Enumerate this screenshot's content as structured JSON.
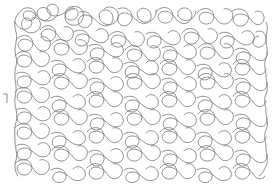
{
  "image": {
    "title": "Stipple Meander Quilting Pattern",
    "kind": "line-drawing",
    "width": 279,
    "height": 195,
    "background_color": "#ffffff",
    "stroke_color": "#7d7d7d",
    "stroke_width": 0.85,
    "description": "Continuous wandering meander / stipple quilting motif filling a rectangular field with interlocking puzzle-piece lobes."
  },
  "pattern": {
    "name": "stipple-meander",
    "region": {
      "x": 14,
      "y": 6,
      "width": 252,
      "height": 176
    },
    "cell": 22,
    "lobe_radius": 8.5,
    "seed": 20240517,
    "row_count": 8,
    "column_count": 11,
    "density_label": "dense",
    "paths": [
      "M 18 14 C 22 6, 32 6, 35 12 C 38 18, 32 22, 27 20 C 22 18, 22 12, 27 11 C 33 10, 36 16, 40 19 C 46 23, 52 18, 50 12 C 48 7, 41 6, 38 10 C 35 14, 39 20, 45 21 C 54 22, 60 14, 58 8 C 57 4, 51 3, 48 6 C 45 10, 49 16, 55 16 C 64 16, 68 8, 72 8 C 78 8, 80 14, 76 18 C 72 22, 65 20, 65 14 C 65 8, 72 5, 78 7 C 84 9, 85 17, 81 22 C 77 27, 69 26, 66 21 C 63 16, 67 9, 74 9",
      "M 80 12 C 86 10, 92 14, 92 20 C 92 27, 84 30, 80 26 C 76 22, 79 15, 85 15 C 92 15, 96 21, 100 24 C 106 28, 113 25, 113 18 C 113 12, 107 8, 102 11 C 97 14, 99 22, 105 24 C 113 27, 120 20, 118 13 C 116 7, 108 5, 104 9",
      "M 118 9 C 124 6, 131 9, 132 16 C 133 23, 126 28, 121 25 C 116 22, 117 14, 123 13 C 130 12, 134 19, 139 22 C 145 26, 152 22, 151 15 C 150 9, 143 6, 139 10 C 135 14, 138 21, 144 22 C 152 23, 157 16, 156 10",
      "M 156 12 C 160 6, 169 6, 172 12 C 175 18, 170 24, 164 23 C 158 22, 156 15, 161 12 C 167 9, 173 14, 176 19 C 180 25, 188 25, 191 19 C 194 13, 189 7, 183 8 C 177 9, 176 16, 181 19 C 188 23, 196 18, 196 11",
      "M 197 13 C 201 7, 210 7, 213 13 C 216 19, 211 25, 205 24 C 199 23, 197 16, 202 13 C 208 10, 214 15, 217 20 C 221 26, 229 25, 232 19 C 235 13, 230 7, 224 9",
      "M 232 11 C 238 7, 246 9, 248 15 C 250 21, 245 27, 239 26 C 233 25, 231 18, 236 15 C 242 12, 249 16, 252 21 C 256 27, 263 25, 264 19 C 265 13, 259 9, 255 12",
      "M 15 22 C 18 30, 26 31, 30 27 C 34 23, 31 17, 26 18 C 21 19, 20 26, 24 30 C 29 35, 38 33, 40 27 C 42 21, 37 16, 32 18",
      "M 40 30 C 44 24, 52 24, 55 30 C 58 36, 53 42, 47 41 C 41 40, 39 33, 44 30 C 50 27, 56 32, 59 37 C 63 43, 71 42, 73 36 C 75 30, 69 25, 64 27",
      "M 74 32 C 80 28, 88 31, 89 37 C 90 44, 83 48, 78 45 C 73 42, 75 35, 81 34 C 88 33, 92 40, 97 42 C 104 45, 110 40, 108 34 C 106 28, 99 27, 96 31",
      "M 109 36 C 113 30, 122 30, 125 36 C 128 42, 123 48, 117 47 C 111 46, 109 39, 114 36 C 120 33, 127 38, 130 43 C 134 49, 142 47, 144 41 C 146 35, 140 30, 135 32",
      "M 146 34 C 152 30, 160 33, 161 39 C 162 46, 155 50, 150 47 C 145 44, 147 37, 153 36 C 160 35, 164 42, 169 44 C 176 47, 182 42, 180 36 C 178 30, 171 29, 168 33",
      "M 182 33 C 186 27, 195 27, 198 33 C 201 39, 196 45, 190 44 C 184 43, 182 36, 187 33 C 193 30, 200 35, 203 40 C 207 46, 215 44, 217 38 C 219 32, 213 27, 208 29",
      "M 219 34 C 225 30, 233 33, 234 39 C 235 46, 228 50, 223 47 C 218 44, 220 37, 226 36 C 233 35, 237 42, 242 44 C 249 47, 256 42, 254 36 C 252 30, 245 29, 242 33",
      "M 256 32 C 261 29, 266 33, 266 39 C 266 46, 259 49, 255 46 C 251 43, 253 36, 259 36",
      "M 16 40 C 20 34, 29 34, 32 40 C 35 46, 30 52, 24 51 C 18 50, 16 43, 21 40 C 27 37, 33 42, 36 47 C 40 53, 48 52, 50 46 C 52 40, 46 35, 41 37",
      "M 52 44 C 56 38, 65 38, 68 44 C 71 50, 66 56, 60 55 C 54 54, 52 47, 57 44 C 63 41, 70 46, 73 51 C 77 57, 85 55, 87 49 C 89 43, 83 38, 78 40",
      "M 89 46 C 95 42, 103 45, 104 51 C 105 58, 98 62, 93 59 C 88 56, 90 49, 96 48 C 103 47, 107 54, 112 56 C 119 59, 125 54, 123 48 C 121 42, 114 41, 111 45",
      "M 125 50 C 129 44, 138 44, 141 50 C 144 56, 139 62, 133 61 C 127 60, 125 53, 130 50 C 136 47, 143 52, 146 57 C 150 63, 158 61, 160 55 C 162 49, 156 44, 151 46",
      "M 162 48 C 168 44, 176 47, 177 53 C 178 60, 171 64, 166 61 C 161 58, 163 51, 169 50 C 176 49, 180 56, 185 58 C 192 61, 198 56, 196 50 C 194 44, 187 43, 184 47",
      "M 198 48 C 202 42, 211 42, 214 48 C 217 54, 212 60, 206 59 C 200 58, 198 51, 203 48 C 209 45, 216 50, 219 55 C 223 61, 231 59, 233 53 C 235 47, 229 42, 224 44",
      "M 235 50 C 241 46, 249 49, 250 55 C 251 62, 244 66, 239 63 C 234 60, 236 53, 242 52 C 249 51, 253 58, 258 60 C 264 62, 268 58, 267 52",
      "M 15 56 C 19 50, 28 50, 31 56 C 34 62, 29 68, 23 67 C 17 66, 15 59, 20 56 C 26 53, 32 58, 35 63 C 39 69, 47 67, 49 61 C 51 55, 45 50, 40 52",
      "M 51 62 C 57 58, 65 61, 66 67 C 67 74, 60 78, 55 75 C 50 72, 52 65, 58 64 C 65 63, 69 70, 74 72 C 81 75, 87 70, 85 64 C 83 58, 76 57, 73 61",
      "M 87 62 C 91 56, 100 56, 103 62 C 106 68, 101 74, 95 73 C 89 72, 87 65, 92 62 C 98 59, 105 64, 108 69 C 112 75, 120 73, 122 67 C 124 61, 118 56, 113 58",
      "M 124 64 C 130 60, 138 63, 139 69 C 140 76, 133 80, 128 77 C 123 74, 125 67, 131 66 C 138 65, 142 72, 147 74 C 154 77, 160 72, 158 66 C 156 60, 149 59, 146 63",
      "M 160 64 C 164 58, 173 58, 176 64 C 179 70, 174 76, 168 75 C 162 74, 160 67, 165 64 C 171 61, 178 66, 181 71 C 185 77, 193 75, 195 69 C 197 63, 191 58, 186 60",
      "M 197 66 C 203 62, 211 65, 212 71 C 213 78, 206 82, 201 79 C 196 76, 198 69, 204 68 C 211 67, 215 74, 220 76 C 227 79, 233 74, 231 68 C 229 62, 222 61, 219 65",
      "M 233 64 C 237 58, 246 58, 249 64 C 252 70, 247 76, 241 75 C 235 74, 233 67, 238 64 C 244 61, 251 66, 254 71 C 258 77, 265 75, 266 69",
      "M 16 74 C 22 70, 30 73, 31 79 C 32 86, 25 90, 20 87 C 15 84, 17 77, 23 76 C 30 75, 34 82, 39 84 C 46 87, 52 82, 50 76 C 48 70, 41 69, 38 73",
      "M 52 78 C 56 72, 65 72, 68 78 C 71 84, 66 90, 60 89 C 54 88, 52 81, 57 78 C 63 75, 70 80, 73 85 C 77 91, 85 89, 87 83 C 89 77, 83 72, 78 74",
      "M 89 80 C 95 76, 103 79, 104 85 C 105 92, 98 96, 93 93 C 88 90, 90 83, 96 82 C 103 81, 107 88, 112 90 C 119 93, 125 88, 123 82 C 121 76, 114 75, 111 79",
      "M 125 78 C 129 72, 138 72, 141 78 C 144 84, 139 90, 133 89 C 127 88, 125 81, 130 78 C 136 75, 143 80, 146 85 C 150 91, 158 89, 160 83 C 162 77, 156 72, 151 74",
      "M 162 80 C 168 76, 176 79, 177 85 C 178 92, 171 96, 166 93 C 161 90, 163 83, 169 82 C 176 81, 180 88, 185 90 C 192 93, 198 88, 196 82 C 194 76, 187 75, 184 79",
      "M 198 78 C 202 72, 211 72, 214 78 C 217 84, 212 90, 206 89 C 200 88, 198 81, 203 78 C 209 75, 216 80, 219 85 C 223 91, 231 89, 233 83 C 235 77, 229 72, 224 74",
      "M 235 80 C 241 76, 249 79, 250 85 C 251 92, 244 96, 239 93 C 234 90, 236 83, 242 82 C 249 81, 253 88, 258 90 C 264 92, 268 88, 267 82",
      "M 15 92 C 19 86, 28 86, 31 92 C 34 98, 29 104, 23 103 C 17 102, 15 95, 20 92 C 26 89, 32 94, 35 99 C 39 105, 47 103, 49 97 C 51 91, 45 86, 40 88",
      "M 51 98 C 57 94, 65 97, 66 103 C 67 110, 60 114, 55 111 C 50 108, 52 101, 58 100 C 65 99, 69 106, 74 108 C 81 111, 87 106, 85 100 C 83 94, 76 93, 73 97",
      "M 87 96 C 91 90, 100 90, 103 96 C 106 102, 101 108, 95 107 C 89 106, 87 99, 92 96 C 98 93, 105 98, 108 103 C 112 109, 120 107, 122 101 C 124 95, 118 90, 113 92",
      "M 124 98 C 130 94, 138 97, 139 103 C 140 110, 133 114, 128 111 C 123 108, 125 101, 131 100 C 138 99, 142 106, 147 108 C 154 111, 160 106, 158 100 C 156 94, 149 93, 146 97",
      "M 160 96 C 164 90, 173 90, 176 96 C 179 102, 174 108, 168 107 C 162 106, 160 99, 165 96 C 171 93, 178 98, 181 103 C 185 109, 193 107, 195 101 C 197 95, 191 90, 186 92",
      "M 197 98 C 203 94, 211 97, 212 103 C 213 110, 206 114, 201 111 C 196 108, 198 101, 204 100 C 211 99, 215 106, 220 108 C 227 111, 233 106, 231 100 C 229 94, 222 93, 219 97",
      "M 233 96 C 237 90, 246 90, 249 96 C 252 102, 247 108, 241 107 C 235 106, 233 99, 238 96 C 244 93, 251 98, 254 103 C 258 109, 265 107, 266 101",
      "M 16 110 C 22 106, 30 109, 31 115 C 32 122, 25 126, 20 123 C 15 120, 17 113, 23 112 C 30 111, 34 118, 39 120 C 46 123, 52 118, 50 112 C 48 106, 41 105, 38 109",
      "M 52 114 C 56 108, 65 108, 68 114 C 71 120, 66 126, 60 125 C 54 124, 52 117, 57 114 C 63 111, 70 116, 73 121 C 77 127, 85 125, 87 119 C 89 113, 83 108, 78 110",
      "M 89 116 C 95 112, 103 115, 104 121 C 105 128, 98 132, 93 129 C 88 126, 90 119, 96 118 C 103 117, 107 124, 112 126 C 119 129, 125 124, 123 118 C 121 112, 114 111, 111 115",
      "M 125 114 C 129 108, 138 108, 141 114 C 144 120, 139 126, 133 125 C 127 124, 125 117, 130 114 C 136 111, 143 116, 146 121 C 150 127, 158 125, 160 119 C 162 113, 156 108, 151 110",
      "M 162 116 C 168 112, 176 115, 177 121 C 178 128, 171 132, 166 129 C 161 126, 163 119, 169 118 C 176 117, 180 124, 185 126 C 192 129, 198 124, 196 118 C 194 112, 187 111, 184 115",
      "M 198 114 C 202 108, 211 108, 214 114 C 217 120, 212 126, 206 125 C 200 124, 198 117, 203 114 C 209 111, 216 116, 219 121 C 223 127, 231 125, 233 119 C 235 113, 229 108, 224 110",
      "M 235 116 C 241 112, 249 115, 250 121 C 251 128, 244 132, 239 129 C 234 126, 236 119, 242 118 C 249 117, 253 124, 258 126 C 264 128, 268 124, 267 118",
      "M 15 128 C 19 122, 28 122, 31 128 C 34 134, 29 140, 23 139 C 17 138, 15 131, 20 128 C 26 125, 32 130, 35 135 C 39 141, 47 139, 49 133 C 51 127, 45 122, 40 124",
      "M 51 134 C 57 130, 65 133, 66 139 C 67 146, 60 150, 55 147 C 50 144, 52 137, 58 136 C 65 135, 69 142, 74 144 C 81 147, 87 142, 85 136 C 83 130, 76 129, 73 133",
      "M 87 132 C 91 126, 100 126, 103 132 C 106 138, 101 144, 95 143 C 89 142, 87 135, 92 132 C 98 129, 105 134, 108 139 C 112 145, 120 143, 122 137 C 124 131, 118 126, 113 128",
      "M 124 134 C 130 130, 138 133, 139 139 C 140 146, 133 150, 128 147 C 123 144, 125 137, 131 136 C 138 135, 142 142, 147 144 C 154 147, 160 142, 158 136 C 156 130, 149 129, 146 133",
      "M 160 132 C 164 126, 173 126, 176 132 C 179 138, 174 144, 168 143 C 162 142, 160 135, 165 132 C 171 129, 178 134, 181 139 C 185 145, 193 143, 195 137 C 197 131, 191 126, 186 128",
      "M 197 134 C 203 130, 211 133, 212 139 C 213 146, 206 150, 201 147 C 196 144, 198 137, 204 136 C 211 135, 215 142, 220 144 C 227 147, 233 142, 231 136 C 229 130, 222 129, 219 133",
      "M 233 132 C 237 126, 246 126, 249 132 C 252 138, 247 144, 241 143 C 235 142, 233 135, 238 132 C 244 129, 251 134, 254 139 C 258 145, 265 143, 266 137",
      "M 16 146 C 22 142, 30 145, 31 151 C 32 158, 25 162, 20 159 C 15 156, 17 149, 23 148 C 30 147, 34 154, 39 156 C 46 159, 52 154, 50 148 C 48 142, 41 141, 38 145",
      "M 52 150 C 56 144, 65 144, 68 150 C 71 156, 66 162, 60 161 C 54 160, 52 153, 57 150 C 63 147, 70 152, 73 157 C 77 163, 85 161, 87 155 C 89 149, 83 144, 78 146",
      "M 89 152 C 95 148, 103 151, 104 157 C 105 164, 98 168, 93 165 C 88 162, 90 155, 96 154 C 103 153, 107 160, 112 162 C 119 165, 125 160, 123 154 C 121 148, 114 147, 111 151",
      "M 125 150 C 129 144, 138 144, 141 150 C 144 156, 139 162, 133 161 C 127 160, 125 153, 130 150 C 136 147, 143 152, 146 157 C 150 163, 158 161, 160 155 C 162 149, 156 144, 151 146",
      "M 162 152 C 168 148, 176 151, 177 157 C 178 164, 171 168, 166 165 C 161 162, 163 155, 169 154 C 176 153, 180 160, 185 162 C 192 165, 198 160, 196 154 C 194 148, 187 147, 184 151",
      "M 198 150 C 202 144, 211 144, 214 150 C 217 156, 212 162, 206 161 C 200 160, 198 153, 203 150 C 209 147, 216 152, 219 157 C 223 163, 231 161, 233 155 C 235 149, 229 144, 224 146",
      "M 235 152 C 241 148, 249 151, 250 157 C 251 164, 244 168, 239 165 C 234 162, 236 155, 242 154 C 249 153, 253 160, 258 162 C 264 164, 268 160, 267 154",
      "M 15 164 C 19 158, 28 158, 31 164 C 34 170, 29 176, 23 175 C 17 174, 15 167, 20 164 C 26 161, 32 166, 35 171 C 39 177, 47 175, 49 169 C 51 163, 45 158, 40 160",
      "M 51 170 C 57 166, 65 169, 66 175 C 67 181, 61 184, 56 182 C 51 180, 52 173, 58 172 C 65 171, 69 178, 74 180 C 81 182, 87 178, 85 172 C 83 166, 76 165, 73 169",
      "M 87 168 C 91 162, 100 162, 103 168 C 106 174, 101 180, 95 179 C 89 178, 87 171, 92 168 C 98 165, 105 170, 108 175 C 112 181, 120 179, 122 173 C 124 167, 118 162, 113 164",
      "M 124 170 C 130 166, 138 169, 139 175 C 140 181, 134 184, 129 182 C 124 180, 125 173, 131 172 C 138 171, 142 178, 147 180 C 154 182, 160 178, 158 172 C 156 166, 149 165, 146 169",
      "M 160 168 C 164 162, 173 162, 176 168 C 179 174, 174 180, 168 179 C 162 178, 160 171, 165 168 C 171 165, 178 170, 181 175 C 185 181, 193 179, 195 173 C 197 167, 191 162, 186 164",
      "M 197 170 C 203 166, 211 169, 212 175 C 213 181, 207 184, 202 182 C 197 180, 198 173, 204 172 C 211 171, 215 178, 220 180 C 227 182, 233 178, 231 172 C 229 166, 222 165, 219 169",
      "M 233 168 C 237 162, 246 162, 249 168 C 252 174, 247 180, 241 179 C 235 178, 233 171, 238 168 C 244 165, 251 170, 254 175 C 257 180, 263 180, 265 176",
      "M 18 14 C 14 18, 14 26, 16 32 C 18 38, 15 44, 15 50 C 15 56, 18 60, 16 66 C 14 72, 15 80, 16 86 C 17 92, 14 98, 15 104 C 16 110, 18 116, 16 122 C 14 128, 15 136, 15 142 C 15 148, 18 154, 16 160 C 14 166, 15 172, 18 176",
      "M 266 22 C 269 28, 266 34, 266 40 C 266 46, 269 52, 266 58 C 263 64, 266 70, 266 76 C 266 82, 269 88, 266 94 C 263 100, 266 106, 266 112 C 266 118, 269 124, 266 130 C 263 136, 266 142, 266 148 C 266 154, 269 160, 266 166 C 264 171, 262 174, 259 176"
    ],
    "edge_mark": {
      "name": "left-edge-tick",
      "path": "M 3 94 L 7 94 L 7 103",
      "color": "#8a8a8a"
    }
  }
}
